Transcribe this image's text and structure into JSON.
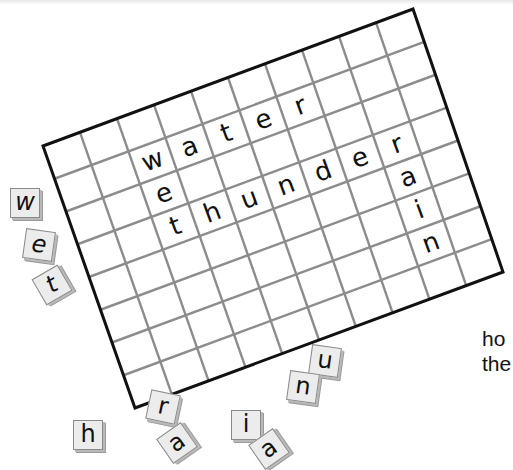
{
  "puzzle": {
    "grid": {
      "columns": 10,
      "rows": 8,
      "corners": {
        "top_left": [
          43,
          146
        ],
        "top_right": [
          413,
          9
        ],
        "bottom_left": [
          135,
          408
        ],
        "bottom_right": [
          503,
          272
        ]
      },
      "border_color": "#111111",
      "line_color": "#8c8c8c",
      "placed_letters": [
        {
          "word": "water",
          "letters": [
            {
              "ch": "w",
              "row": 1,
              "col": 2
            },
            {
              "ch": "a",
              "row": 1,
              "col": 3
            },
            {
              "ch": "t",
              "row": 1,
              "col": 4
            },
            {
              "ch": "e",
              "row": 1,
              "col": 5
            },
            {
              "ch": "r",
              "row": 1,
              "col": 6
            }
          ]
        },
        {
          "word": "wet",
          "letters": [
            {
              "ch": "e",
              "row": 2,
              "col": 2
            },
            {
              "ch": "t",
              "row": 3,
              "col": 2
            }
          ]
        },
        {
          "word": "thunder",
          "letters": [
            {
              "ch": "h",
              "row": 3,
              "col": 3
            },
            {
              "ch": "u",
              "row": 3,
              "col": 4
            },
            {
              "ch": "n",
              "row": 3,
              "col": 5
            },
            {
              "ch": "d",
              "row": 3,
              "col": 6
            },
            {
              "ch": "e",
              "row": 3,
              "col": 7
            },
            {
              "ch": "r",
              "row": 3,
              "col": 8
            }
          ]
        },
        {
          "word": "rain",
          "letters": [
            {
              "ch": "a",
              "row": 4,
              "col": 8
            },
            {
              "ch": "i",
              "row": 5,
              "col": 8
            },
            {
              "ch": "n",
              "row": 6,
              "col": 8
            }
          ]
        }
      ]
    },
    "tiles": [
      {
        "id": "tile-w",
        "letter": "w",
        "x": 10,
        "y": 188,
        "rot": 0,
        "italic": true
      },
      {
        "id": "tile-e",
        "letter": "e",
        "x": 24,
        "y": 230,
        "rot": 8,
        "italic": true
      },
      {
        "id": "tile-t",
        "letter": "t",
        "x": 37,
        "y": 270,
        "rot": -30,
        "italic": true
      },
      {
        "id": "tile-r",
        "letter": "r",
        "x": 148,
        "y": 392,
        "rot": 12,
        "italic": false
      },
      {
        "id": "tile-h",
        "letter": "h",
        "x": 73,
        "y": 420,
        "rot": 0,
        "italic": false
      },
      {
        "id": "tile-a",
        "letter": "a",
        "x": 162,
        "y": 428,
        "rot": -35,
        "italic": false
      },
      {
        "id": "tile-i",
        "letter": "i",
        "x": 231,
        "y": 410,
        "rot": 0,
        "italic": false
      },
      {
        "id": "tile-partial",
        "letter": "a",
        "x": 254,
        "y": 434,
        "rot": -35,
        "italic": false
      },
      {
        "id": "tile-u",
        "letter": "u",
        "x": 310,
        "y": 346,
        "rot": 8,
        "italic": false
      },
      {
        "id": "tile-n",
        "letter": "n",
        "x": 288,
        "y": 372,
        "rot": 8,
        "italic": false
      }
    ]
  },
  "side_text": {
    "line1": "ho",
    "line2": "the"
  }
}
